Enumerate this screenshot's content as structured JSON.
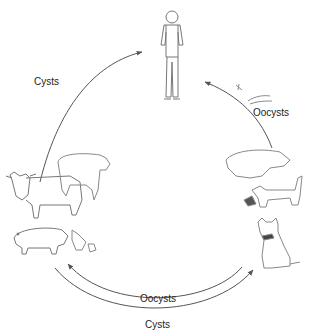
{
  "diagram": {
    "type": "life-cycle",
    "nodes": [
      {
        "id": "human",
        "label": "Human",
        "icon": "human-figure-icon"
      },
      {
        "id": "livestock",
        "label": "Cattle, sheep, pig, chicken",
        "icon": "livestock-icon"
      },
      {
        "id": "cats",
        "label": "Cats",
        "icon": "cat-icon"
      }
    ],
    "edges": [
      {
        "from": "livestock",
        "to": "human",
        "label": "Cysts"
      },
      {
        "from": "cats",
        "to": "human",
        "label": "Oocysts"
      },
      {
        "from": "cats",
        "to": "livestock",
        "label": "Oocysts"
      },
      {
        "from": "livestock",
        "to": "cats",
        "label": "Cysts"
      }
    ]
  },
  "labels": {
    "cysts_top": "Cysts",
    "oocysts_right": "Oocysts",
    "oocysts_bottom": "Oocysts",
    "cysts_bottom": "Cysts"
  },
  "colors": {
    "line": "#555555",
    "sketch": "#777777",
    "text": "#222222"
  }
}
